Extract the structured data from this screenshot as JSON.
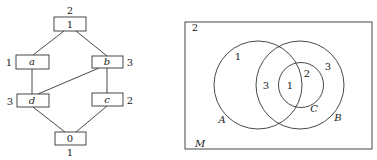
{
  "lattice": {
    "nodes": [
      {
        "id": "top",
        "label": "1",
        "weight": "2",
        "italic": false
      },
      {
        "id": "a",
        "label": "a",
        "weight": "1",
        "italic": true
      },
      {
        "id": "b",
        "label": "b",
        "weight": "3",
        "italic": true
      },
      {
        "id": "d",
        "label": "d",
        "weight": "3",
        "italic": true
      },
      {
        "id": "c",
        "label": "c",
        "weight": "2",
        "italic": true
      },
      {
        "id": "bottom",
        "label": "0",
        "weight": "1",
        "italic": false
      }
    ],
    "edges": [
      [
        "top",
        "a"
      ],
      [
        "top",
        "b"
      ],
      [
        "a",
        "d"
      ],
      [
        "b",
        "d"
      ],
      [
        "b",
        "c"
      ],
      [
        "d",
        "bottom"
      ],
      [
        "c",
        "bottom"
      ]
    ]
  },
  "venn": {
    "universe_label": "M",
    "universe_value": "2",
    "sets": [
      {
        "name": "A",
        "label": "A"
      },
      {
        "name": "B",
        "label": "B"
      },
      {
        "name": "C",
        "label": "C"
      }
    ],
    "regions": {
      "A_only": "1",
      "A_and_B_not_C": "3",
      "A_and_B_and_C": "1",
      "B_and_C_not_A": "2",
      "B_only": "3"
    }
  }
}
